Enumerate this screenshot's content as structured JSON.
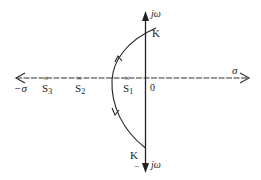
{
  "diagram": {
    "type": "root-locus",
    "axes": {
      "real_positive_label": "σ",
      "real_negative_label": "−σ",
      "imag_positive_label": "jω",
      "imag_negative_label": "jω",
      "imag_negative_sign": "−",
      "origin_label": "0"
    },
    "poles": [
      {
        "label_main": "S",
        "label_sub": "3",
        "x": 46
      },
      {
        "label_main": "S",
        "label_sub": "2",
        "x": 79
      },
      {
        "label_main": "S",
        "label_sub": "1",
        "x": 127
      }
    ],
    "crossings": {
      "upper_label": "K",
      "lower_label": "K"
    },
    "colors": {
      "line": "#222222",
      "background": "#ffffff"
    }
  }
}
